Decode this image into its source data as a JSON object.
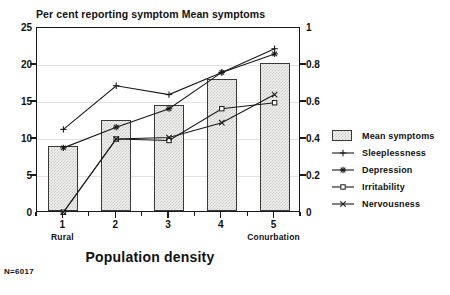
{
  "chart_data": {
    "type": "bar",
    "title": "Per cent reporting symptom  Mean symptoms",
    "xlabel": "Population density",
    "ylabel": "Per cent reporting symptom",
    "y2label": "Mean symptoms",
    "categories": [
      "1",
      "2",
      "3",
      "4",
      "5"
    ],
    "category_endpoints": {
      "left": "Rural",
      "right": "Conurbation"
    },
    "ylim": [
      0,
      25
    ],
    "yticks": [
      "0",
      "5",
      "10",
      "15",
      "20",
      "25"
    ],
    "ytick_values": [
      0,
      5,
      10,
      15,
      20,
      25
    ],
    "y2lim": [
      0,
      1
    ],
    "y2ticks": [
      "0",
      "0.2",
      "0.4",
      "0.6",
      "0.8",
      "1"
    ],
    "y2tick_values": [
      0,
      0.2,
      0.4,
      0.6,
      0.8,
      1
    ],
    "grid": true,
    "legend_position": "right",
    "annotation": "N=6017",
    "bars": {
      "name": "Mean symptoms",
      "axis": "right",
      "values": [
        0.35,
        0.49,
        0.57,
        0.71,
        0.8
      ],
      "values_left_scale": [
        8.8,
        12.3,
        14.3,
        17.8,
        20.0
      ]
    },
    "series": [
      {
        "name": "Sleeplessness",
        "marker": "plus",
        "axis": "left",
        "values": [
          11.3,
          17.2,
          16.0,
          19.0,
          22.2
        ]
      },
      {
        "name": "Depression",
        "marker": "star",
        "axis": "left",
        "values": [
          8.8,
          11.6,
          14.1,
          19.0,
          21.5
        ]
      },
      {
        "name": "Irritability",
        "marker": "square",
        "axis": "left",
        "values": [
          0.1,
          10.0,
          9.8,
          14.1,
          14.9
        ]
      },
      {
        "name": "Nervousness",
        "marker": "cross",
        "axis": "left",
        "values": [
          0.1,
          10.0,
          10.2,
          12.2,
          16.0
        ]
      }
    ]
  },
  "legend": {
    "items": [
      {
        "label": "Mean symptoms",
        "key": "box"
      },
      {
        "label": "Sleeplessness",
        "key": "plus"
      },
      {
        "label": "Depression",
        "key": "star"
      },
      {
        "label": "Irritability",
        "key": "square"
      },
      {
        "label": "Nervousness",
        "key": "cross"
      }
    ]
  }
}
